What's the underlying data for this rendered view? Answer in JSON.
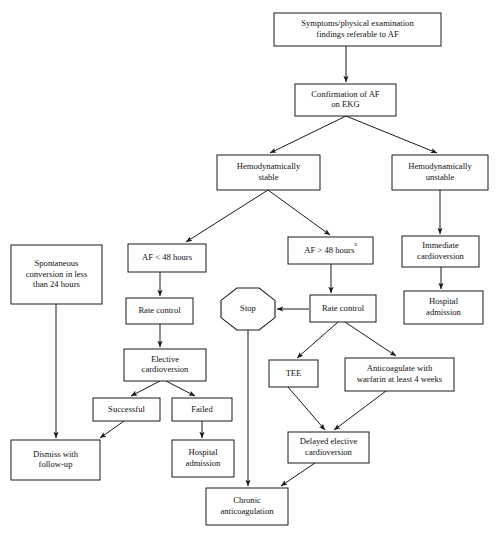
{
  "chart_data": {
    "type": "diagram",
    "diagram_kind": "flowchart",
    "orientation": "top-down",
    "nodes": [
      {
        "id": "symptoms",
        "shape": "rect",
        "lines": [
          "Symptoms/physical examination",
          "findings referable to AF"
        ],
        "x": 274,
        "y": 13,
        "w": 167,
        "h": 33
      },
      {
        "id": "confirmation",
        "shape": "rect",
        "lines": [
          "Confirmation of AF",
          "on EKG"
        ],
        "x": 295,
        "y": 84,
        "w": 101,
        "h": 32
      },
      {
        "id": "hemo-stable",
        "shape": "rect",
        "lines": [
          "Hemodynamically",
          "stable"
        ],
        "x": 217,
        "y": 155,
        "w": 103,
        "h": 35
      },
      {
        "id": "hemo-unstable",
        "shape": "rect",
        "lines": [
          "Hemodynamically",
          "unstable"
        ],
        "x": 392,
        "y": 155,
        "w": 96,
        "h": 35
      },
      {
        "id": "af-lt-48",
        "shape": "rect",
        "lines": [
          "AF < 48 hours"
        ],
        "x": 128,
        "y": 244,
        "w": 78,
        "h": 28
      },
      {
        "id": "af-gt-48",
        "shape": "rect",
        "lines": [
          "AF > 48 hours"
        ],
        "superscript": "a",
        "x": 288,
        "y": 237,
        "w": 85,
        "h": 27
      },
      {
        "id": "immediate-cv",
        "shape": "rect",
        "lines": [
          "Immediate",
          "cardioversion"
        ],
        "x": 402,
        "y": 236,
        "w": 77,
        "h": 31
      },
      {
        "id": "spontaneous",
        "shape": "rect",
        "lines": [
          "Spontaneous",
          "conversion in less",
          "than 24 hours"
        ],
        "x": 11,
        "y": 245,
        "w": 91,
        "h": 59
      },
      {
        "id": "hospital-adm-r",
        "shape": "rect",
        "lines": [
          "Hospital",
          "admission"
        ],
        "x": 404,
        "y": 291,
        "w": 79,
        "h": 33
      },
      {
        "id": "rate-control-l",
        "shape": "rect",
        "lines": [
          "Rate control"
        ],
        "x": 126,
        "y": 298,
        "w": 67,
        "h": 26
      },
      {
        "id": "rate-control-r",
        "shape": "rect",
        "lines": [
          "Rate control"
        ],
        "x": 310,
        "y": 295,
        "w": 66,
        "h": 27
      },
      {
        "id": "stop",
        "shape": "octagon",
        "lines": [
          "Stop"
        ],
        "x": 221,
        "y": 288,
        "w": 54,
        "h": 42
      },
      {
        "id": "elective-cv",
        "shape": "rect",
        "lines": [
          "Elective",
          "cardioversion"
        ],
        "x": 124,
        "y": 349,
        "w": 82,
        "h": 32
      },
      {
        "id": "tee",
        "shape": "rect",
        "lines": [
          "TEE"
        ],
        "x": 269,
        "y": 360,
        "w": 49,
        "h": 27
      },
      {
        "id": "anticoag-warf",
        "shape": "rect",
        "lines": [
          "Anticoagulate with",
          "warfarin at least 4 weeks"
        ],
        "x": 345,
        "y": 358,
        "w": 109,
        "h": 33
      },
      {
        "id": "successful",
        "shape": "rect",
        "lines": [
          "Successful"
        ],
        "x": 93,
        "y": 398,
        "w": 67,
        "h": 23
      },
      {
        "id": "failed",
        "shape": "rect",
        "lines": [
          "Failed"
        ],
        "x": 172,
        "y": 398,
        "w": 60,
        "h": 23
      },
      {
        "id": "delayed-cv",
        "shape": "rect",
        "lines": [
          "Delayed elective",
          "cardioversion"
        ],
        "x": 288,
        "y": 432,
        "w": 81,
        "h": 31
      },
      {
        "id": "dismiss",
        "shape": "rect",
        "lines": [
          "Dismiss with",
          "follow-up"
        ],
        "x": 11,
        "y": 440,
        "w": 89,
        "h": 40
      },
      {
        "id": "hospital-adm-m",
        "shape": "rect",
        "lines": [
          "Hospital",
          "admission"
        ],
        "x": 172,
        "y": 440,
        "w": 62,
        "h": 37
      },
      {
        "id": "chronic-anticoag",
        "shape": "rect",
        "lines": [
          "Chronic",
          "anticoagulation"
        ],
        "x": 206,
        "y": 488,
        "w": 82,
        "h": 37
      }
    ],
    "edges": [
      {
        "from": "symptoms",
        "to": "confirmation",
        "path": "M346,46 L346,82",
        "arrow": true
      },
      {
        "from": "confirmation",
        "to": "hemo-stable",
        "path": "M346,116 L270,153",
        "arrow": true
      },
      {
        "from": "confirmation",
        "to": "hemo-unstable",
        "path": "M346,116 L437,153",
        "arrow": true
      },
      {
        "from": "hemo-stable",
        "to": "af-lt-48",
        "path": "M268,190 L186,242",
        "arrow": true
      },
      {
        "from": "hemo-stable",
        "to": "af-gt-48",
        "path": "M268,190 L330,235",
        "arrow": true
      },
      {
        "from": "hemo-unstable",
        "to": "immediate-cv",
        "path": "M440,190 L440,234",
        "arrow": true
      },
      {
        "from": "immediate-cv",
        "to": "hospital-adm-r",
        "path": "M441,267 L441,289",
        "arrow": true
      },
      {
        "from": "af-lt-48",
        "to": "rate-control-l",
        "path": "M160,272 L160,296",
        "arrow": true
      },
      {
        "from": "af-gt-48",
        "to": "rate-control-r",
        "path": "M331,264 L331,293",
        "arrow": true
      },
      {
        "from": "rate-control-r",
        "to": "stop",
        "path": "M309,309 L277,309",
        "arrow": true
      },
      {
        "from": "rate-control-l",
        "to": "elective-cv",
        "path": "M160,324 L160,347",
        "arrow": true
      },
      {
        "from": "rate-control-r",
        "to": "tee",
        "path": "M338,322 L297,358",
        "arrow": true
      },
      {
        "from": "rate-control-r",
        "to": "anticoag-warf",
        "path": "M345,322 L396,356",
        "arrow": true
      },
      {
        "from": "elective-cv",
        "to": "successful",
        "path": "M160,381 L131,396",
        "arrow": true
      },
      {
        "from": "elective-cv",
        "to": "failed",
        "path": "M166,381 L195,396",
        "arrow": true
      },
      {
        "from": "successful",
        "to": "dismiss",
        "path": "M124,421 L100,438",
        "arrow": true
      },
      {
        "from": "failed",
        "to": "hospital-adm-m",
        "path": "M202,421 L202,438",
        "arrow": true
      },
      {
        "from": "spontaneous",
        "to": "dismiss",
        "path": "M56,304 L56,438",
        "arrow": true
      },
      {
        "from": "tee",
        "to": "delayed-cv",
        "path": "M288,387 L325,430",
        "arrow": true
      },
      {
        "from": "anticoag-warf",
        "to": "delayed-cv",
        "path": "M386,391 L334,430",
        "arrow": true
      },
      {
        "from": "stop",
        "to": "chronic-anticoag",
        "path": "M248,330 L248,486",
        "arrow": true
      },
      {
        "from": "delayed-cv",
        "to": "chronic-anticoag",
        "path": "M315,463 L281,486",
        "arrow": true
      }
    ]
  }
}
